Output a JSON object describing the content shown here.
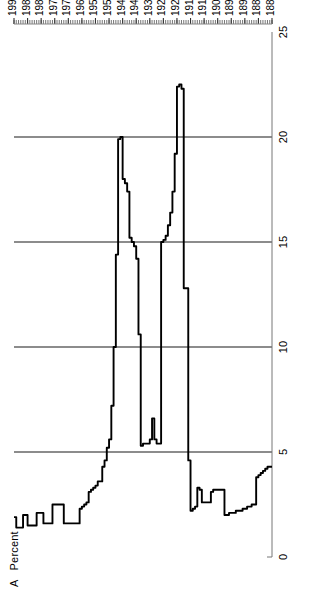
{
  "figure": {
    "panel_letter": "A",
    "unit_label": "Percent"
  },
  "axes": {
    "y_ticks": [
      25,
      20,
      15,
      10,
      5,
      0
    ],
    "y_gridline_values": [
      20,
      15,
      10,
      5
    ],
    "y_min": 0,
    "y_max": 25,
    "x_min": 1880,
    "x_max": 1994,
    "x_tick_labels": [
      "1880",
      "1886",
      "1892",
      "1898",
      "1904",
      "1910",
      "1916",
      "1922",
      "1928",
      "1934",
      "1940",
      "1946",
      "1952",
      "1958",
      "1964",
      "1970",
      "1976",
      "1982",
      "1988",
      "1994"
    ],
    "x_minor_tick_step": 1,
    "x_major_tick_step": 6
  },
  "style": {
    "line_color": "#000000",
    "grid_color": "#1a1a1a",
    "axis_color": "#555555",
    "background": "#ffffff"
  },
  "chart_data": {
    "type": "line",
    "title": "",
    "subtitle": "",
    "xlabel": "",
    "ylabel": "Percent",
    "xlim": [
      1880,
      1994
    ],
    "ylim": [
      0,
      25
    ],
    "grid": true,
    "legend": null,
    "annotations": [
      {
        "text": "A",
        "role": "panel-letter"
      },
      {
        "text": "Percent",
        "role": "y-axis-unit"
      }
    ],
    "series": [
      {
        "name": "Percent",
        "x": [
          1880,
          1881,
          1882,
          1883,
          1884,
          1885,
          1886,
          1887,
          1888,
          1889,
          1890,
          1891,
          1892,
          1893,
          1894,
          1895,
          1896,
          1897,
          1898,
          1899,
          1900,
          1901,
          1902,
          1903,
          1904,
          1905,
          1906,
          1907,
          1908,
          1909,
          1910,
          1911,
          1912,
          1913,
          1914,
          1915,
          1916,
          1917,
          1918,
          1919,
          1920,
          1921,
          1922,
          1923,
          1924,
          1925,
          1926,
          1927,
          1928,
          1929,
          1930,
          1931,
          1932,
          1933,
          1934,
          1935,
          1936,
          1937,
          1938,
          1939,
          1940,
          1941,
          1942,
          1943,
          1944,
          1945,
          1946,
          1947,
          1948,
          1949,
          1950,
          1951,
          1952,
          1953,
          1954,
          1955,
          1956,
          1957,
          1958,
          1959,
          1960,
          1961,
          1962,
          1963,
          1964,
          1965,
          1966,
          1967,
          1968,
          1969,
          1970,
          1971,
          1972,
          1973,
          1974,
          1975,
          1976,
          1977,
          1978,
          1979,
          1980,
          1981,
          1982,
          1983,
          1984,
          1985,
          1986,
          1987,
          1988,
          1989,
          1990,
          1991,
          1992,
          1993,
          1994
        ],
        "values": [
          4.3,
          4.3,
          4.1,
          3.6,
          3.5,
          3.4,
          3.3,
          3.3,
          3.2,
          3.2,
          3.1,
          3.1,
          2.9,
          2.9,
          2.9,
          2.9,
          2.9,
          2.9,
          2.9,
          2.6,
          2.6,
          2.6,
          2.6,
          2.6,
          2.6,
          2.2,
          2.2,
          2.2,
          2.2,
          2.2,
          2.1,
          2.1,
          2.1,
          2.0,
          2.0,
          1.8,
          2.0,
          2.6,
          3.2,
          3.2,
          3.0,
          2.1,
          1.8,
          1.8,
          1.8,
          1.8,
          1.8,
          1.8,
          1.8,
          1.8,
          2.0,
          2.3,
          2.6,
          2.8,
          2.8,
          2.6,
          2.6,
          2.6,
          2.6,
          2.6,
          2.6,
          2.4,
          2.3,
          2.1,
          2.1,
          2.1,
          2.0,
          2.0,
          1.9,
          1.9,
          1.9,
          1.9,
          1.8,
          1.8,
          1.7,
          1.7,
          1.6,
          1.6,
          1.6,
          1.5,
          1.5,
          1.5,
          1.5,
          1.5,
          1.5,
          1.5,
          1.5,
          1.5,
          1.5,
          1.5,
          1.5,
          1.4,
          1.4,
          1.4,
          1.4,
          1.3,
          1.3,
          1.3,
          1.3,
          1.3,
          1.3,
          1.3,
          1.3,
          1.3,
          1.3,
          1.2,
          1.2,
          1.2,
          1.2,
          1.2,
          1.2,
          1.2,
          1.2,
          1.2,
          1.2
        ],
        "peaks": [
          {
            "x": 1918,
            "y": 22.5,
            "label": "World War I peak"
          },
          {
            "x": 1943,
            "y": 20.0,
            "label": "World War II peak"
          },
          {
            "x": 1931,
            "y": 6.6,
            "label": "Great Depression bump"
          }
        ]
      }
    ]
  }
}
